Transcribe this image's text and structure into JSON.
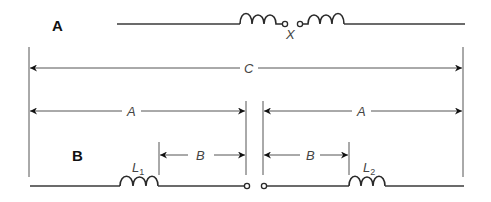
{
  "diagram": {
    "part_a": {
      "label": "A",
      "gap_label": "X"
    },
    "part_b": {
      "label": "B",
      "inductor_1": {
        "label": "L",
        "subscript": "1"
      },
      "inductor_2": {
        "label": "L",
        "subscript": "2"
      }
    },
    "dimensions": {
      "overall": "C",
      "left_half": "A",
      "right_half": "A",
      "left_inner": "B",
      "right_inner": "B"
    },
    "colors": {
      "line": "#3a3a3a",
      "dimension": "#555555",
      "background": "#ffffff"
    }
  }
}
